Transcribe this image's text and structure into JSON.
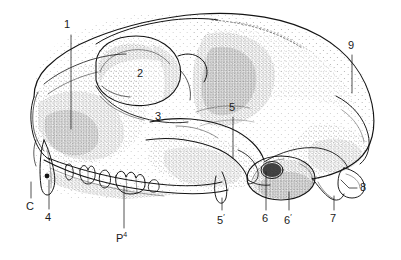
{
  "figure": {
    "kind": "anatomical-illustration",
    "style": "stippled pen-and-ink line drawing",
    "background_color": "#ffffff",
    "ink_color": "#1a1a1a",
    "width": 401,
    "height": 260
  },
  "labels": [
    {
      "id": "1",
      "text": "1",
      "x": 68,
      "y": 24,
      "leader": "vertical"
    },
    {
      "id": "2",
      "text": "2",
      "x": 140,
      "y": 73,
      "leader": "none"
    },
    {
      "id": "3",
      "text": "3",
      "x": 158,
      "y": 116,
      "leader": "none"
    },
    {
      "id": "5",
      "text": "5",
      "x": 230,
      "y": 106,
      "leader": "vertical"
    },
    {
      "id": "9",
      "text": "9",
      "x": 349,
      "y": 44,
      "leader": "vertical"
    },
    {
      "id": "8",
      "text": "8",
      "x": 361,
      "y": 186,
      "leader": "angled"
    },
    {
      "id": "C",
      "text": "C",
      "x": 28,
      "y": 207,
      "leader": "vertical"
    },
    {
      "id": "4",
      "text": "4",
      "x": 46,
      "y": 218,
      "leader": "vertical"
    },
    {
      "id": "P4",
      "text": "P",
      "sup": "4",
      "x": 118,
      "y": 238,
      "leader": "vertical"
    },
    {
      "id": "5prime",
      "text": "5",
      "prime": "′",
      "x": 219,
      "y": 220,
      "leader": "vertical"
    },
    {
      "id": "6",
      "text": "6",
      "x": 263,
      "y": 220,
      "leader": "vertical"
    },
    {
      "id": "6prime",
      "text": "6",
      "prime": "′",
      "x": 285,
      "y": 220,
      "leader": "vertical"
    },
    {
      "id": "7",
      "text": "7",
      "x": 331,
      "y": 220,
      "leader": "vertical"
    }
  ]
}
